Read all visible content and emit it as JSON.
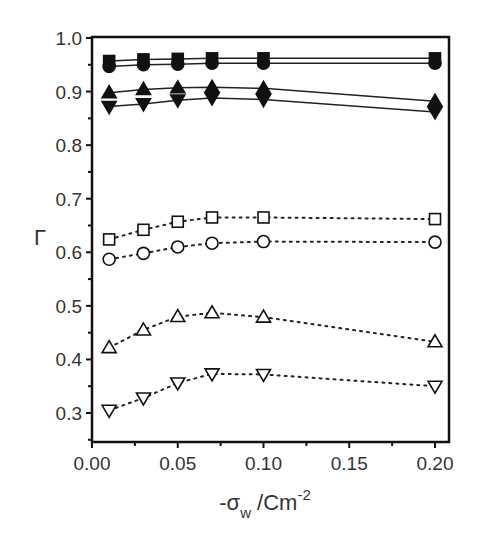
{
  "chart_data": {
    "type": "line",
    "title": "",
    "xlabel": "-σw /Cm^-2",
    "xlabel_parts": {
      "prefix": "-σ",
      "sub": "w",
      "mid": " /Cm",
      "sup": "-2"
    },
    "ylabel": "Γ",
    "xlim": [
      0.0,
      0.21
    ],
    "ylim": [
      0.24,
      1.0
    ],
    "xticks": [
      "0.00",
      "0.05",
      "0.10",
      "0.15",
      "0.20"
    ],
    "yticks": [
      "0.3",
      "0.4",
      "0.5",
      "0.6",
      "0.7",
      "0.8",
      "0.9",
      "1.0"
    ],
    "grid": false,
    "legend": null,
    "x": [
      0.01,
      0.03,
      0.05,
      0.07,
      0.1,
      0.2
    ],
    "series": [
      {
        "name": "filled square",
        "marker": "square",
        "filled": true,
        "line": "solid",
        "values": [
          0.957,
          0.96,
          0.961,
          0.962,
          0.962,
          0.962
        ]
      },
      {
        "name": "filled circle",
        "marker": "circle",
        "filled": true,
        "line": "solid",
        "values": [
          0.947,
          0.95,
          0.951,
          0.953,
          0.953,
          0.953
        ]
      },
      {
        "name": "filled up-triangle",
        "marker": "triangle-up",
        "filled": true,
        "line": "solid",
        "values": [
          0.898,
          0.904,
          0.907,
          0.908,
          0.906,
          0.882
        ]
      },
      {
        "name": "filled down-triangle",
        "marker": "triangle-down",
        "filled": true,
        "line": "solid",
        "values": [
          0.872,
          0.877,
          0.884,
          0.888,
          0.885,
          0.862
        ]
      },
      {
        "name": "open square",
        "marker": "square",
        "filled": false,
        "line": "dotted",
        "values": [
          0.624,
          0.642,
          0.657,
          0.665,
          0.665,
          0.662
        ]
      },
      {
        "name": "open circle",
        "marker": "circle",
        "filled": false,
        "line": "dotted",
        "values": [
          0.587,
          0.598,
          0.61,
          0.617,
          0.62,
          0.619
        ]
      },
      {
        "name": "open up-triangle",
        "marker": "triangle-up",
        "filled": false,
        "line": "dotted",
        "values": [
          0.422,
          0.455,
          0.48,
          0.487,
          0.479,
          0.433
        ]
      },
      {
        "name": "open down-triangle",
        "marker": "triangle-down",
        "filled": false,
        "line": "dotted",
        "values": [
          0.305,
          0.328,
          0.356,
          0.373,
          0.372,
          0.35
        ]
      }
    ]
  }
}
